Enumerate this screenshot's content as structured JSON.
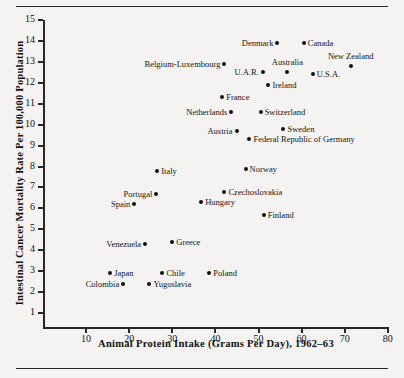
{
  "figure": {
    "background_color": "#f4f3f1",
    "has_top_rule": true,
    "has_bottom_rule": true
  },
  "chart_data": {
    "type": "scatter",
    "title": "",
    "xlabel": "Animal Protein Intake (Grams Per Day), 1962–63",
    "ylabel": "Intestinal Cancer Mortality Rate Per 100,000 Population",
    "xlim": [
      0,
      80
    ],
    "ylim": [
      0,
      15
    ],
    "xticks": [
      10,
      20,
      30,
      40,
      50,
      60,
      70,
      80
    ],
    "xtick_labels": [
      "10",
      "20",
      "30",
      "40",
      "50",
      "60",
      "70",
      "80"
    ],
    "yticks": [
      1,
      2,
      3,
      4,
      5,
      6,
      7,
      8,
      9,
      10,
      11,
      12,
      13,
      14,
      15
    ],
    "ytick_labels": [
      "1",
      "2",
      "3",
      "4",
      "5",
      "6",
      "7",
      "8",
      "9",
      "10",
      "11",
      "12",
      "13",
      "14",
      "15"
    ],
    "grid": false,
    "legend": false,
    "marker_color": "#111111",
    "points": [
      {
        "label": "Denmark",
        "x": 54.4,
        "y": 13.9,
        "label_side": "left"
      },
      {
        "label": "Canada",
        "x": 60.5,
        "y": 13.9,
        "label_side": "right"
      },
      {
        "label": "Belgium-Luxembourg",
        "x": 42.1,
        "y": 12.9,
        "label_side": "left"
      },
      {
        "label": "New Zealand",
        "x": 71.4,
        "y": 12.8,
        "label_side": "above"
      },
      {
        "label": "U.A.R.",
        "x": 51.0,
        "y": 12.5,
        "label_side": "left"
      },
      {
        "label": "Australia",
        "x": 56.7,
        "y": 12.5,
        "label_side": "above"
      },
      {
        "label": "U.S.A.",
        "x": 62.6,
        "y": 12.4,
        "label_side": "right"
      },
      {
        "label": "Ireland",
        "x": 52.3,
        "y": 11.9,
        "label_side": "right"
      },
      {
        "label": "France",
        "x": 41.6,
        "y": 11.3,
        "label_side": "right"
      },
      {
        "label": "Netherlands",
        "x": 43.7,
        "y": 10.6,
        "label_side": "left"
      },
      {
        "label": "Switzerland",
        "x": 50.5,
        "y": 10.6,
        "label_side": "right"
      },
      {
        "label": "Sweden",
        "x": 55.8,
        "y": 9.8,
        "label_side": "right"
      },
      {
        "label": "Austria",
        "x": 44.9,
        "y": 9.7,
        "label_side": "left"
      },
      {
        "label": "Federal Republic of Germany",
        "x": 47.9,
        "y": 9.3,
        "label_side": "right"
      },
      {
        "label": "Norway",
        "x": 47.0,
        "y": 7.9,
        "label_side": "right"
      },
      {
        "label": "Italy",
        "x": 26.5,
        "y": 7.8,
        "label_side": "right"
      },
      {
        "label": "Czechoslovakia",
        "x": 42.1,
        "y": 6.8,
        "label_side": "right"
      },
      {
        "label": "Portugal",
        "x": 26.3,
        "y": 6.7,
        "label_side": "left"
      },
      {
        "label": "Hungary",
        "x": 36.7,
        "y": 6.3,
        "label_side": "right"
      },
      {
        "label": "Spain",
        "x": 21.2,
        "y": 6.2,
        "label_side": "left"
      },
      {
        "label": "Finland",
        "x": 51.2,
        "y": 5.7,
        "label_side": "right"
      },
      {
        "label": "Greece",
        "x": 30.0,
        "y": 4.4,
        "label_side": "right"
      },
      {
        "label": "Venezuela",
        "x": 23.7,
        "y": 4.3,
        "label_side": "left"
      },
      {
        "label": "Poland",
        "x": 38.6,
        "y": 2.9,
        "label_side": "right"
      },
      {
        "label": "Chile",
        "x": 27.7,
        "y": 2.9,
        "label_side": "right"
      },
      {
        "label": "Japan",
        "x": 15.6,
        "y": 2.9,
        "label_side": "right"
      },
      {
        "label": "Yugoslavia",
        "x": 24.7,
        "y": 2.4,
        "label_side": "right"
      },
      {
        "label": "Colombia",
        "x": 18.6,
        "y": 2.4,
        "label_side": "left"
      }
    ]
  }
}
